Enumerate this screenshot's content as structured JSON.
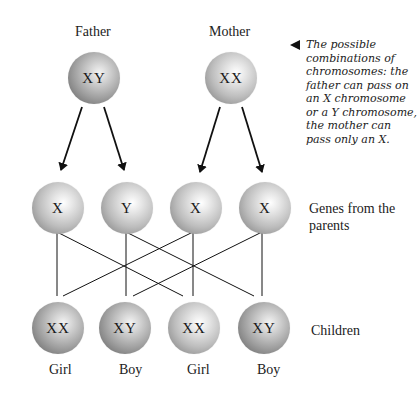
{
  "parents": {
    "father": {
      "label": "Father",
      "chromosomes": "XY"
    },
    "mother": {
      "label": "Mother",
      "chromosomes": "XX"
    }
  },
  "caption": "The possible combinations of chromosomes: the father can pass on an X chromosome or a Y chromosome, the mother can pass only an X.",
  "genes": {
    "row_label": "Genes from the parents",
    "items": [
      {
        "chromosome": "X",
        "from": "father"
      },
      {
        "chromosome": "Y",
        "from": "father"
      },
      {
        "chromosome": "X",
        "from": "mother"
      },
      {
        "chromosome": "X",
        "from": "mother"
      }
    ]
  },
  "children": {
    "row_label": "Children",
    "items": [
      {
        "chromosomes": "XX",
        "sex": "Girl"
      },
      {
        "chromosomes": "XY",
        "sex": "Boy"
      },
      {
        "chromosomes": "XX",
        "sex": "Girl"
      },
      {
        "chromosomes": "XY",
        "sex": "Boy"
      }
    ]
  },
  "colors": {
    "line": "#111111",
    "text": "#222222"
  }
}
